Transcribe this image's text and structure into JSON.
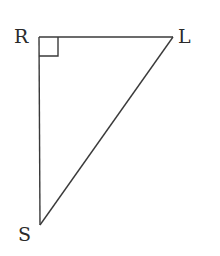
{
  "diagram": {
    "type": "right-triangle",
    "vertices": [
      {
        "name": "R",
        "label": "R",
        "x": 39,
        "y": 37
      },
      {
        "name": "L",
        "label": "L",
        "x": 173,
        "y": 37
      },
      {
        "name": "S",
        "label": "S",
        "x": 40,
        "y": 225
      }
    ],
    "right_angle_at": "R",
    "edges": [
      [
        "R",
        "L"
      ],
      [
        "R",
        "S"
      ],
      [
        "L",
        "S"
      ]
    ],
    "stroke_color": "#3a3a3a",
    "label_color": "#2a2a2a"
  }
}
